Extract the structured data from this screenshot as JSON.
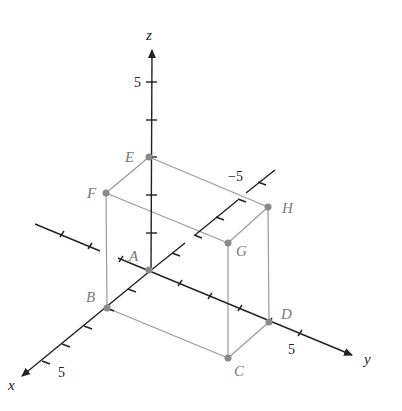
{
  "diagram": {
    "type": "3d-coordinate-box",
    "axes": {
      "x": {
        "label": "x",
        "tick_label": "5"
      },
      "y": {
        "label": "y",
        "tick_label": "5"
      },
      "z": {
        "label": "z",
        "tick_label": "5"
      },
      "neg_y_tick_label": "−5"
    },
    "points": [
      {
        "name": "A",
        "label": "A"
      },
      {
        "name": "B",
        "label": "B"
      },
      {
        "name": "C",
        "label": "C"
      },
      {
        "name": "D",
        "label": "D"
      },
      {
        "name": "E",
        "label": "E"
      },
      {
        "name": "F",
        "label": "F"
      },
      {
        "name": "G",
        "label": "G"
      },
      {
        "name": "H",
        "label": "H"
      }
    ],
    "colors": {
      "axis": "#222222",
      "box": "#999999",
      "point": "#8a8a8a"
    }
  }
}
